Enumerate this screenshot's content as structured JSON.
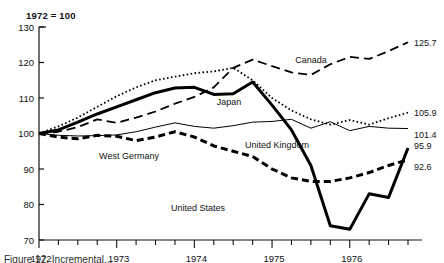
{
  "figure": {
    "index_note": "1972 = 100",
    "caption_fragment": "Figure 12. Incremental...",
    "axis": {
      "y_ticks": [
        130,
        120,
        110,
        100,
        90,
        80,
        70
      ],
      "ylim": [
        70,
        130
      ],
      "x_year_labels": [
        "1972",
        "1973",
        "1974",
        "1975",
        "1976"
      ],
      "xlim": [
        0,
        19
      ]
    }
  },
  "chart_data": {
    "type": "line",
    "title": "",
    "subtitle": "1972 = 100",
    "xlabel": "",
    "ylabel": "",
    "ylim": [
      70,
      130
    ],
    "grid": false,
    "legend": "inline-annotations",
    "x": [
      "1972Q1",
      "1972Q2",
      "1972Q3",
      "1972Q4",
      "1973Q1",
      "1973Q2",
      "1973Q3",
      "1973Q4",
      "1974Q1",
      "1974Q2",
      "1974Q3",
      "1974Q4",
      "1975Q1",
      "1975Q2",
      "1975Q3",
      "1975Q4",
      "1976Q1",
      "1976Q2",
      "1976Q3",
      "1976Q4"
    ],
    "x_tick_labels": [
      "1972",
      "1973",
      "1974",
      "1975",
      "1976"
    ],
    "series": [
      {
        "name": "Canada",
        "style": "long-dash",
        "end_value": 125.7,
        "values": [
          100.0,
          100.5,
          101.8,
          104.0,
          103.0,
          104.5,
          106.2,
          108.4,
          110.3,
          113.0,
          118.5,
          120.8,
          119.0,
          117.2,
          116.5,
          119.5,
          121.6,
          121.0,
          123.2,
          125.7
        ]
      },
      {
        "name": "Japan",
        "style": "dotted",
        "end_value": 105.9,
        "values": [
          100.0,
          102.0,
          104.5,
          107.5,
          110.5,
          113.0,
          115.0,
          116.0,
          117.0,
          117.5,
          118.5,
          115.0,
          110.0,
          106.5,
          104.0,
          102.5,
          103.8,
          102.5,
          104.3,
          105.9
        ]
      },
      {
        "name": "United Kingdom",
        "style": "thin-solid",
        "end_value": 101.4,
        "values": [
          100.0,
          99.5,
          99.3,
          99.4,
          99.6,
          100.5,
          101.8,
          103.0,
          102.0,
          101.5,
          102.2,
          103.2,
          103.4,
          104.0,
          101.5,
          103.3,
          100.8,
          102.0,
          101.5,
          101.4
        ]
      },
      {
        "name": "United States",
        "style": "thick-solid",
        "end_value": 95.9,
        "values": [
          100.0,
          101.0,
          103.2,
          105.5,
          107.5,
          109.5,
          111.5,
          112.8,
          113.0,
          111.0,
          111.2,
          114.5,
          108.0,
          101.0,
          91.0,
          74.0,
          73.0,
          83.0,
          82.0,
          95.9
        ]
      },
      {
        "name": "West Germany",
        "style": "bold-dash",
        "end_value": 92.6,
        "values": [
          100.0,
          99.0,
          98.5,
          99.5,
          99.2,
          98.0,
          99.0,
          100.5,
          99.0,
          96.5,
          95.0,
          93.5,
          90.0,
          87.5,
          86.5,
          86.5,
          87.5,
          89.0,
          91.0,
          92.6
        ]
      }
    ],
    "annotations": [
      {
        "text": "Canada",
        "x": 311,
        "y": 63
      },
      {
        "text": "Japan",
        "x": 229,
        "y": 105
      },
      {
        "text": "United Kingdom",
        "x": 277,
        "y": 148
      },
      {
        "text": "West Germany",
        "x": 129,
        "y": 159
      },
      {
        "text": "United States",
        "x": 198,
        "y": 211
      }
    ],
    "end_labels": [
      {
        "text": "125.7",
        "value": 125.7,
        "series": "Canada"
      },
      {
        "text": "105.9",
        "value": 105.9,
        "series": "Japan"
      },
      {
        "text": "101.4",
        "value": 101.4,
        "series": "United Kingdom"
      },
      {
        "text": "95.9",
        "value": 95.9,
        "series": "United States"
      },
      {
        "text": "92.6",
        "value": 92.6,
        "series": "West Germany"
      }
    ]
  }
}
